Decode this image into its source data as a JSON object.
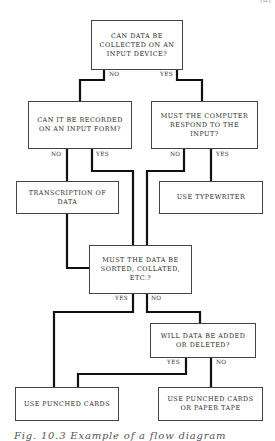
{
  "corner_mark": "(a)",
  "boxes": {
    "q_input_device": "CAN DATA BE COLLECTED ON AN INPUT DEVICE?",
    "q_input_form": "CAN IT BE RECORDED ON AN INPUT FORM?",
    "q_computer_respond": "MUST THE COMPUTER RESPOND TO THE INPUT?",
    "transcription": "TRANSCRIPTION OF DATA",
    "use_typewriter": "USE TYPEWRITER",
    "q_sorted": "MUST THE DATA BE SORTED, COLLATED, ETC.?",
    "q_added_deleted": "WILL DATA BE ADDED OR DELETED?",
    "use_punched_cards": "USE PUNCHED CARDS",
    "use_cards_or_tape": "USE PUNCHED CARDS OR PAPER TAPE"
  },
  "labels": {
    "no": "NO",
    "yes": "YES"
  },
  "caption": "Fig. 10.3   Example of a flow diagram"
}
